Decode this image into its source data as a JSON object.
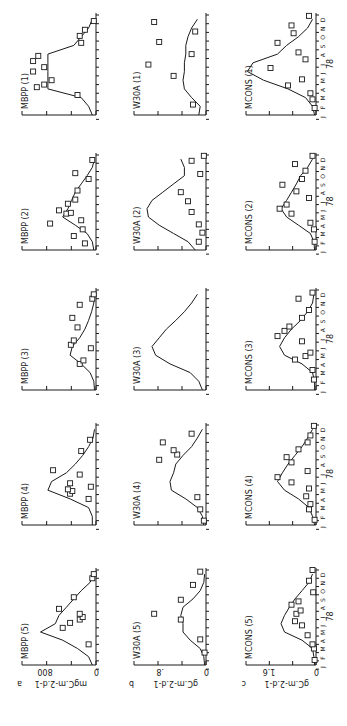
{
  "figure": {
    "orientation": "rotated -90deg (page in landscape)",
    "caption": "",
    "rows": [
      {
        "letter": "a",
        "prefix": "MBPP",
        "ylabel": "mgC.m-2.d-1",
        "ytick_labels": [
          "0",
          "800"
        ],
        "ymax": 1000
      },
      {
        "letter": "b",
        "prefix": "W30A",
        "ylabel": "gC.m-2.d-1",
        "ytick_labels": [
          "0",
          ".8"
        ],
        "ymax": 1.1
      },
      {
        "letter": "c",
        "prefix": "MCONS",
        "ylabel": "gC.m-2.d-1",
        "ytick_labels": [
          "0",
          "1.6"
        ],
        "ymax": 2.2
      }
    ],
    "row_b_station1_ytick": "4",
    "stations": [
      "(5)",
      "(4)",
      "(3)",
      "(2)",
      "(1)"
    ],
    "month_labels": [
      "J",
      "F",
      "M",
      "A",
      "M",
      "J",
      "J",
      "A",
      "S",
      "O",
      "N",
      "D"
    ],
    "year_label": "78"
  },
  "chart_data": [
    {
      "type": "line",
      "panel": "MBPP (5)",
      "row": "a",
      "x": "month",
      "curve": [
        0.05,
        0.1,
        0.25,
        0.45,
        0.75,
        0.55,
        0.5,
        0.4,
        0.3,
        0.2,
        0.08,
        0.03
      ],
      "points": [
        [
          2.5,
          0.1
        ],
        [
          4.5,
          0.45
        ],
        [
          5.1,
          0.35
        ],
        [
          5.5,
          0.22
        ],
        [
          5.8,
          0.18
        ],
        [
          6.2,
          0.22
        ],
        [
          6.8,
          0.5
        ],
        [
          8.2,
          0.3
        ],
        [
          10.5,
          0.05
        ],
        [
          11,
          0.03
        ]
      ]
    },
    {
      "type": "line",
      "panel": "MBPP (4)",
      "row": "a",
      "curve": [
        0.05,
        0.05,
        0.1,
        0.35,
        0.65,
        0.6,
        0.4,
        0.28,
        0.18,
        0.1,
        0.04,
        0.02
      ],
      "points": [
        [
          3,
          0.1
        ],
        [
          3.6,
          0.35
        ],
        [
          3.9,
          0.32
        ],
        [
          4.1,
          0.38
        ],
        [
          4.4,
          0.07
        ],
        [
          4.8,
          0.35
        ],
        [
          5.8,
          0.22
        ],
        [
          6.3,
          0.58
        ],
        [
          8.5,
          0.2
        ],
        [
          9.8,
          0.08
        ]
      ]
    },
    {
      "type": "line",
      "panel": "MBPP (3)",
      "row": "a",
      "curve": [
        0.02,
        0.03,
        0.08,
        0.2,
        0.35,
        0.32,
        0.22,
        0.15,
        0.1,
        0.06,
        0.03,
        0.02
      ],
      "points": [
        [
          3,
          0.22
        ],
        [
          3.4,
          0.17
        ],
        [
          4.8,
          0.07
        ],
        [
          5.2,
          0.34
        ],
        [
          5.7,
          0.3
        ],
        [
          7.2,
          0.25
        ],
        [
          8.3,
          0.32
        ],
        [
          9.8,
          0.22
        ],
        [
          10.5,
          0.05
        ],
        [
          11,
          0.03
        ]
      ]
    },
    {
      "type": "line",
      "panel": "MBPP (2)",
      "row": "a",
      "curve": [
        0.03,
        0.05,
        0.12,
        0.28,
        0.45,
        0.38,
        0.33,
        0.28,
        0.2,
        0.12,
        0.05,
        0.02
      ],
      "points": [
        [
          0.8,
          0.15
        ],
        [
          1.7,
          0.3
        ],
        [
          2.5,
          0.18
        ],
        [
          3.2,
          0.62
        ],
        [
          3.6,
          0.2
        ],
        [
          4.4,
          0.4
        ],
        [
          4.5,
          0.34
        ],
        [
          4.8,
          0.5
        ],
        [
          5.6,
          0.38
        ],
        [
          6.1,
          0.28
        ],
        [
          7.2,
          0.25
        ],
        [
          8.6,
          0.1
        ],
        [
          9.3,
          0.28
        ],
        [
          10.9,
          0.05
        ]
      ]
    },
    {
      "type": "line",
      "panel": "MBPP (1)",
      "row": "a",
      "curve": [
        0.05,
        0.1,
        0.2,
        0.65,
        0.65,
        0.65,
        0.65,
        0.65,
        0.3,
        0.2,
        0.1,
        0.05
      ],
      "points": [
        [
          2.3,
          0.25
        ],
        [
          3.2,
          0.8
        ],
        [
          3.5,
          0.7
        ],
        [
          4,
          0.6
        ],
        [
          5,
          0.85
        ],
        [
          5.5,
          0.7
        ],
        [
          6.2,
          0.85
        ],
        [
          6.8,
          0.78
        ],
        [
          8.3,
          0.2
        ],
        [
          9.1,
          0.22
        ],
        [
          9.8,
          0.15
        ],
        [
          10.8,
          0.03
        ]
      ]
    },
    {
      "type": "line",
      "panel": "W30A (5)",
      "row": "b",
      "curve": [
        0.02,
        0.03,
        0.08,
        0.22,
        0.32,
        0.32,
        0.35,
        0.32,
        0.18,
        0.08,
        0.03,
        0.02
      ],
      "points": [
        [
          1.5,
          0.02
        ],
        [
          3.1,
          0.08
        ],
        [
          5.5,
          0.35
        ],
        [
          6.2,
          0.72
        ],
        [
          7.9,
          0.35
        ],
        [
          9.7,
          0.18
        ],
        [
          11.3,
          0.08
        ]
      ]
    },
    {
      "type": "line",
      "panel": "W30A (4)",
      "row": "b",
      "curve": [
        0.03,
        0.05,
        0.12,
        0.28,
        0.48,
        0.5,
        0.45,
        0.42,
        0.32,
        0.2,
        0.12,
        0.05
      ],
      "points": [
        [
          0.5,
          0.03
        ],
        [
          1.8,
          0.08
        ],
        [
          3.2,
          0.12
        ],
        [
          7.5,
          0.65
        ],
        [
          8.1,
          0.4
        ],
        [
          8.6,
          0.45
        ],
        [
          9.5,
          0.6
        ],
        [
          10.5,
          0.2
        ]
      ]
    },
    {
      "type": "line",
      "panel": "W30A (3)",
      "row": "b",
      "curve": [
        0.05,
        0.1,
        0.22,
        0.5,
        0.7,
        0.75,
        0.65,
        0.55,
        0.42,
        0.3,
        0.2,
        0.12
      ],
      "points": []
    },
    {
      "type": "line",
      "panel": "W30A (2)",
      "row": "b",
      "curve": [
        0.15,
        0.25,
        0.45,
        0.65,
        0.8,
        0.82,
        0.75,
        0.6,
        0.45,
        0.3,
        0.3,
        0.35
      ],
      "points": [
        [
          1,
          0.1
        ],
        [
          2.1,
          0.05
        ],
        [
          3.1,
          0.1
        ],
        [
          4.6,
          0.2
        ],
        [
          5.9,
          0.25
        ],
        [
          7,
          0.35
        ],
        [
          9.2,
          0.08
        ],
        [
          10.8,
          0.2
        ],
        [
          11.4,
          0.03
        ]
      ]
    },
    {
      "type": "line",
      "panel": "W30A (1)",
      "row": "b",
      "curve": [
        0.1,
        0.08,
        0.2,
        0.3,
        0.32,
        0.3,
        0.3,
        0.28,
        0.28,
        0.25,
        0.2,
        0.12
      ],
      "points": [
        [
          1.2,
          0.18
        ],
        [
          4.5,
          0.45
        ],
        [
          5.8,
          0.8
        ],
        [
          7,
          0.2
        ],
        [
          8.4,
          0.65
        ],
        [
          9.6,
          0.15
        ],
        [
          10.7,
          0.72
        ]
      ]
    },
    {
      "type": "line",
      "panel": "MCONS (5)",
      "row": "c",
      "curve": [
        0.02,
        0.03,
        0.05,
        0.2,
        0.45,
        0.5,
        0.45,
        0.38,
        0.3,
        0.2,
        0.1,
        0.05
      ],
      "points": [
        [
          0.6,
          0.02
        ],
        [
          2,
          0.03
        ],
        [
          2.5,
          0.05
        ],
        [
          3.6,
          0.12
        ],
        [
          4.8,
          0.2
        ],
        [
          5.3,
          0.3
        ],
        [
          6.2,
          0.28
        ],
        [
          6.6,
          0.22
        ],
        [
          7.3,
          0.35
        ],
        [
          7.7,
          0.25
        ],
        [
          8.8,
          0.04
        ],
        [
          10.2,
          0.1
        ],
        [
          11.5,
          0.05
        ]
      ]
    },
    {
      "type": "line",
      "panel": "MCONS (4)",
      "row": "c",
      "curve": [
        0.02,
        0.05,
        0.1,
        0.25,
        0.45,
        0.55,
        0.48,
        0.4,
        0.3,
        0.2,
        0.12,
        0.05
      ],
      "points": [
        [
          0.6,
          0.02
        ],
        [
          1.8,
          0.1
        ],
        [
          2.4,
          0.08
        ],
        [
          3.3,
          0.14
        ],
        [
          4.2,
          0.1
        ],
        [
          4.9,
          0.35
        ],
        [
          5.5,
          0.55
        ],
        [
          6.2,
          0.12
        ],
        [
          7.2,
          0.35
        ],
        [
          7.8,
          0.42
        ],
        [
          8.7,
          0.25
        ],
        [
          9.5,
          0.12
        ],
        [
          10.3,
          0.08
        ],
        [
          11.4,
          0.03
        ]
      ]
    },
    {
      "type": "line",
      "panel": "MCONS (3)",
      "row": "c",
      "curve": [
        0.02,
        0.02,
        0.05,
        0.2,
        0.45,
        0.52,
        0.45,
        0.35,
        0.22,
        0.12,
        0.05,
        0.03
      ],
      "points": [
        [
          1.2,
          0.03
        ],
        [
          2.3,
          0.05
        ],
        [
          3.5,
          0.3
        ],
        [
          3.9,
          0.15
        ],
        [
          4.3,
          0.08
        ],
        [
          5.6,
          0.2
        ],
        [
          6.2,
          0.55
        ],
        [
          6.8,
          0.45
        ],
        [
          7.3,
          0.38
        ],
        [
          8.3,
          0.2
        ],
        [
          9.2,
          0.1
        ],
        [
          10.5,
          0.25
        ],
        [
          11.2,
          0.05
        ]
      ]
    },
    {
      "type": "line",
      "panel": "MCONS (2)",
      "row": "c",
      "curve": [
        0.02,
        0.03,
        0.08,
        0.25,
        0.42,
        0.5,
        0.42,
        0.35,
        0.28,
        0.22,
        0.12,
        0.05
      ],
      "points": [
        [
          1,
          0.02
        ],
        [
          2.5,
          0.03
        ],
        [
          3.3,
          0.08
        ],
        [
          4.4,
          0.35
        ],
        [
          5,
          0.52
        ],
        [
          5.5,
          0.42
        ],
        [
          6.3,
          0.1
        ],
        [
          7.1,
          0.28
        ],
        [
          7.9,
          0.48
        ],
        [
          8.6,
          0.2
        ],
        [
          9.6,
          0.15
        ],
        [
          10.4,
          0.3
        ],
        [
          11.4,
          0.05
        ]
      ]
    },
    {
      "type": "line",
      "panel": "MCONS (1)",
      "row": "c",
      "curve": [
        0.02,
        0.05,
        0.15,
        0.4,
        0.75,
        0.98,
        0.9,
        0.55,
        0.42,
        0.25,
        0.12,
        0.05
      ],
      "points": [
        [
          0.8,
          0.02
        ],
        [
          1.8,
          0.05
        ],
        [
          2.5,
          0.08
        ],
        [
          3.4,
          0.4
        ],
        [
          4.1,
          0.2
        ],
        [
          5.4,
          0.65
        ],
        [
          6.4,
          0.15
        ],
        [
          7.2,
          0.25
        ],
        [
          8.3,
          0.55
        ],
        [
          9.4,
          0.32
        ],
        [
          10.3,
          0.35
        ],
        [
          11.4,
          0.1
        ]
      ]
    }
  ]
}
